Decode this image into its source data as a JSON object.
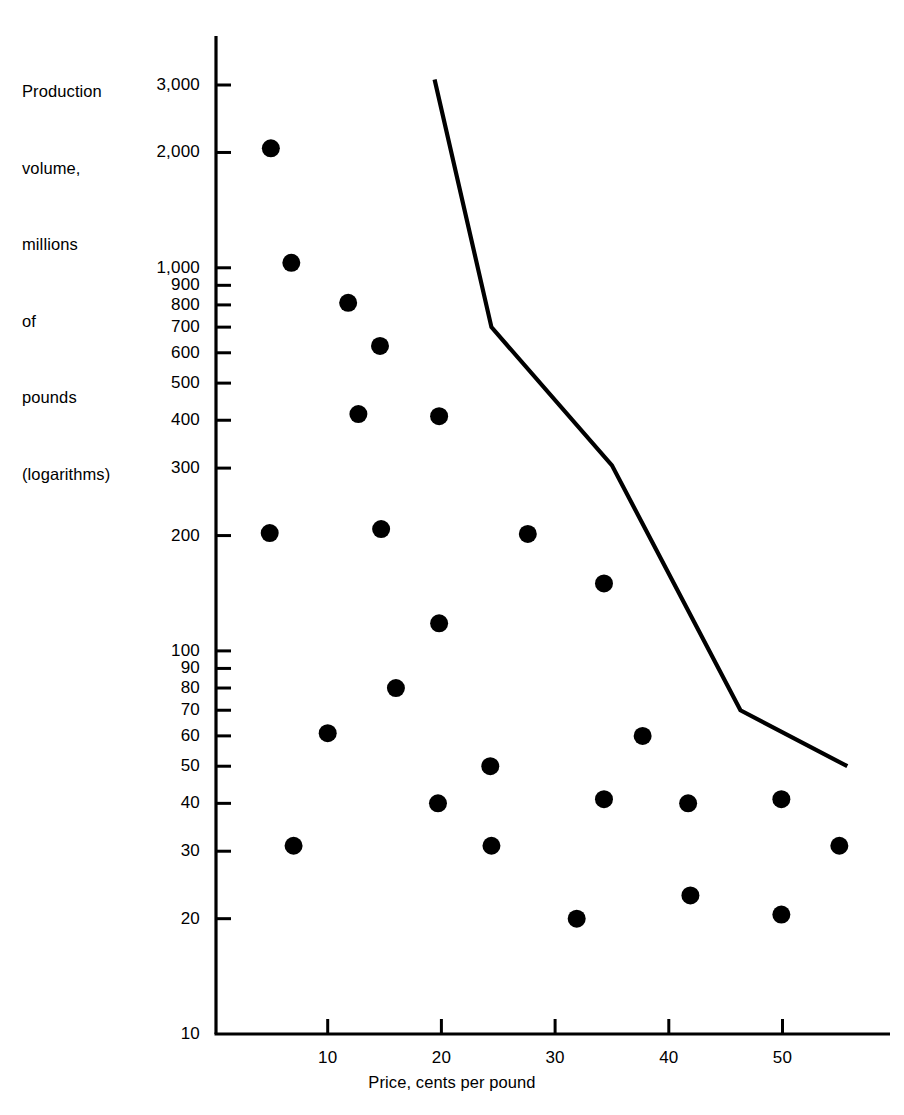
{
  "chart_data": {
    "type": "scatter",
    "title": "",
    "ylabel_lines": [
      "Production",
      "volume,",
      "millions",
      "of",
      "pounds",
      "(logarithms)"
    ],
    "ylabel": "Production volume, millions of pounds (logarithms)",
    "xlabel": "Price, cents per pound",
    "y_scale": "log",
    "x_scale": "linear",
    "ylim": [
      10,
      3200
    ],
    "xlim": [
      0,
      58
    ],
    "grid": false,
    "legend": null,
    "y_ticks": [
      {
        "value": 3000,
        "label": "3,000"
      },
      {
        "value": 2000,
        "label": "2,000"
      },
      {
        "value": 1000,
        "label": "1,000"
      },
      {
        "value": 900,
        "label": "900"
      },
      {
        "value": 800,
        "label": "800"
      },
      {
        "value": 700,
        "label": "700"
      },
      {
        "value": 600,
        "label": "600"
      },
      {
        "value": 500,
        "label": "500"
      },
      {
        "value": 400,
        "label": "400"
      },
      {
        "value": 300,
        "label": "300"
      },
      {
        "value": 200,
        "label": "200"
      },
      {
        "value": 100,
        "label": "100"
      },
      {
        "value": 90,
        "label": "90"
      },
      {
        "value": 80,
        "label": "80"
      },
      {
        "value": 70,
        "label": "70"
      },
      {
        "value": 60,
        "label": "60"
      },
      {
        "value": 50,
        "label": "50"
      },
      {
        "value": 40,
        "label": "40"
      },
      {
        "value": 30,
        "label": "30"
      },
      {
        "value": 20,
        "label": "20"
      },
      {
        "value": 10,
        "label": "10"
      }
    ],
    "x_ticks": [
      {
        "value": 10,
        "label": "10"
      },
      {
        "value": 20,
        "label": "20"
      },
      {
        "value": 30,
        "label": "30"
      },
      {
        "value": 40,
        "label": "40"
      },
      {
        "value": 50,
        "label": "50"
      }
    ],
    "series": [
      {
        "name": "observations",
        "type": "scatter",
        "marker": "filled-circle",
        "color": "#000000",
        "points": [
          {
            "x": 5.0,
            "y": 2050
          },
          {
            "x": 6.8,
            "y": 1030
          },
          {
            "x": 11.8,
            "y": 810
          },
          {
            "x": 14.6,
            "y": 625
          },
          {
            "x": 12.7,
            "y": 415
          },
          {
            "x": 19.8,
            "y": 410
          },
          {
            "x": 4.9,
            "y": 203
          },
          {
            "x": 14.7,
            "y": 208
          },
          {
            "x": 27.6,
            "y": 202
          },
          {
            "x": 34.3,
            "y": 150
          },
          {
            "x": 19.8,
            "y": 118
          },
          {
            "x": 16.0,
            "y": 80
          },
          {
            "x": 10.0,
            "y": 61
          },
          {
            "x": 37.7,
            "y": 60
          },
          {
            "x": 24.3,
            "y": 50
          },
          {
            "x": 19.7,
            "y": 40
          },
          {
            "x": 34.3,
            "y": 41
          },
          {
            "x": 41.7,
            "y": 40
          },
          {
            "x": 49.9,
            "y": 41
          },
          {
            "x": 7.0,
            "y": 31
          },
          {
            "x": 24.4,
            "y": 31
          },
          {
            "x": 55.0,
            "y": 31
          },
          {
            "x": 41.9,
            "y": 23
          },
          {
            "x": 31.9,
            "y": 20
          },
          {
            "x": 49.9,
            "y": 20.5
          }
        ]
      },
      {
        "name": "frontier-line",
        "type": "line",
        "color": "#000000",
        "points": [
          {
            "x": 19.4,
            "y": 3100
          },
          {
            "x": 24.4,
            "y": 700
          },
          {
            "x": 35.0,
            "y": 305
          },
          {
            "x": 46.3,
            "y": 70
          },
          {
            "x": 55.7,
            "y": 50
          }
        ]
      }
    ]
  },
  "geometry": {
    "plot_left": 216,
    "plot_right": 890,
    "plot_top": 36,
    "plot_bottom": 1034,
    "x_px_per_unit": 11.37,
    "x_origin_px": 214,
    "y_top_value": 3000,
    "y_top_px": 85,
    "y_bottom_value": 10,
    "y_bottom_px": 1034,
    "marker_radius": 9,
    "line_width": 4.2,
    "axis_width": 3.2,
    "tick_length": 15,
    "tick_width": 3
  }
}
